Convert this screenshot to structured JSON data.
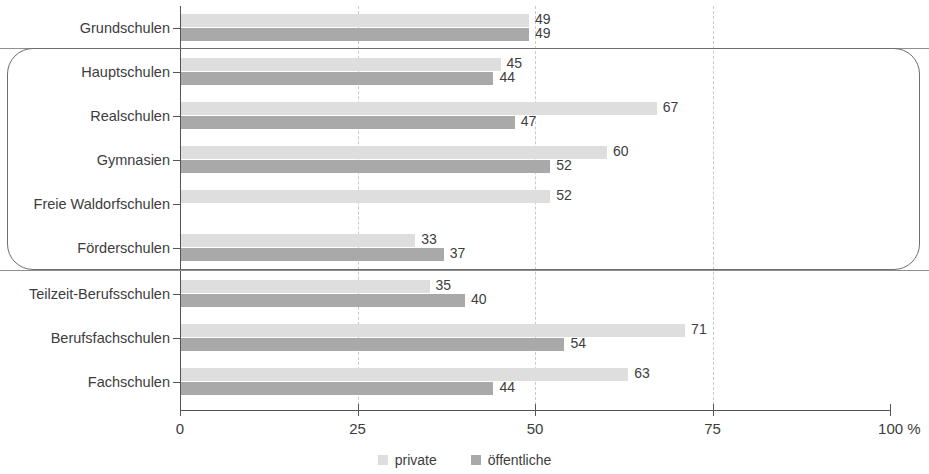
{
  "chart_data": {
    "type": "bar",
    "orientation": "horizontal",
    "title": "",
    "subtitle": "",
    "xlabel": "%",
    "ylabel": "",
    "xlim": [
      0,
      100
    ],
    "xticks": [
      0,
      25,
      50,
      75,
      100
    ],
    "xtick_labels": [
      "0",
      "25",
      "50",
      "75",
      "100 %"
    ],
    "grid": "vertical-dashed",
    "legend_position": "bottom-center",
    "categories": [
      "Grundschulen",
      "Hauptschulen",
      "Realschulen",
      "Gymnasien",
      "Freie Waldorfschulen",
      "Förderschulen",
      "Teilzeit-Berufsschulen",
      "Berufsfachschulen",
      "Fachschulen"
    ],
    "series": [
      {
        "name": "private",
        "color": "#dedede",
        "values": [
          49,
          45,
          67,
          60,
          52,
          33,
          35,
          71,
          63
        ]
      },
      {
        "name": "öffentliche",
        "color": "#a9a9a9",
        "values": [
          49,
          44,
          47,
          52,
          null,
          37,
          40,
          54,
          44
        ]
      }
    ],
    "annotations": {
      "group_box": {
        "label": "",
        "categories": [
          "Hauptschulen",
          "Realschulen",
          "Gymnasien",
          "Freie Waldorfschulen",
          "Förderschulen"
        ]
      },
      "separators": [
        "after-Grundschulen",
        "after-Förderschulen"
      ]
    }
  },
  "legend": {
    "items": [
      {
        "label": "private",
        "color": "#dedede"
      },
      {
        "label": "öffentliche",
        "color": "#a9a9a9"
      }
    ]
  },
  "axis": {
    "ticks": [
      {
        "value": 0,
        "label": "0"
      },
      {
        "value": 25,
        "label": "25"
      },
      {
        "value": 50,
        "label": "50"
      },
      {
        "value": 75,
        "label": "75"
      },
      {
        "value": 100,
        "label": "100 %"
      }
    ]
  }
}
